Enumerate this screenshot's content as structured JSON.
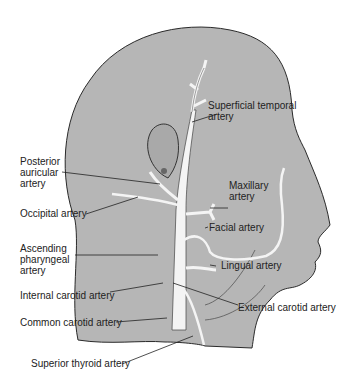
{
  "diagram": {
    "colors": {
      "skin": "#b4b4b4",
      "outline": "#2a2a2a",
      "artery": "#f4f4f4",
      "text": "#222222",
      "background": "#ffffff"
    },
    "labels": {
      "superficial_temporal": "Superficial temporal\nartery",
      "posterior_auricular": "Posterior\nauricular\nartery",
      "maxillary": "Maxillary\nartery",
      "occipital": "Occipital artery",
      "facial": "Facial artery",
      "ascending_pharyngeal": "Ascending\npharyngeal\nartery",
      "lingual": "Lingual artery",
      "internal_carotid": "Internal carotid artery",
      "external_carotid": "External carotid artery",
      "common_carotid": "Common carotid artery",
      "superior_thyroid": "Superior thyroid artery"
    }
  }
}
